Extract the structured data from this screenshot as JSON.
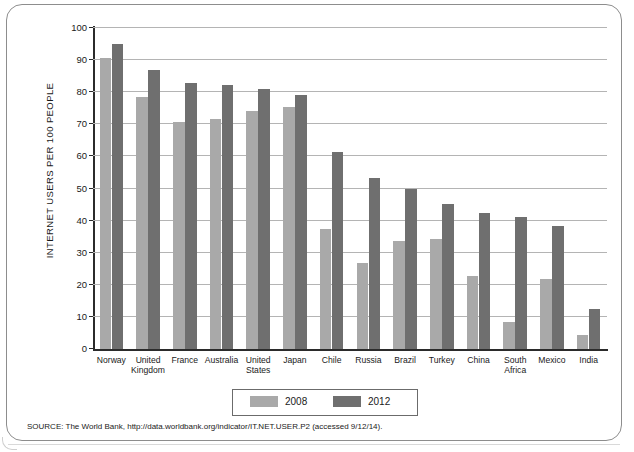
{
  "figure": {
    "y_axis_title": "INTERNET USERS PER 100 PEOPLE",
    "source_note": "SOURCE: The World Bank, http://data.worldbank.org/indicator/IT.NET.USER.P2 (accessed 9/12/14)."
  },
  "legend": {
    "entries": [
      {
        "label": "2008",
        "color": "#a9a9a9"
      },
      {
        "label": "2012",
        "color": "#6f6f6f"
      }
    ]
  },
  "chart_data": {
    "type": "bar",
    "title": "",
    "xlabel": "",
    "ylabel": "INTERNET USERS PER 100 PEOPLE",
    "ylim": [
      0,
      100
    ],
    "yticks": [
      0,
      10,
      20,
      30,
      40,
      50,
      60,
      70,
      80,
      90,
      100
    ],
    "ytick_labels": [
      "0",
      "10",
      "20",
      "30",
      "40",
      "50",
      "60",
      "70",
      "80",
      "90",
      "100"
    ],
    "grid": true,
    "legend_position": "bottom-center",
    "categories": [
      "Norway",
      "United Kingdom",
      "France",
      "Australia",
      "United States",
      "Japan",
      "Chile",
      "Russia",
      "Brazil",
      "Turkey",
      "China",
      "South Africa",
      "Mexico",
      "India"
    ],
    "series": [
      {
        "name": "2008",
        "color": "#a9a9a9",
        "values": [
          90.6,
          78.4,
          70.7,
          71.7,
          74.0,
          75.4,
          37.3,
          26.8,
          33.8,
          34.4,
          22.6,
          8.4,
          21.7,
          4.4
        ]
      },
      {
        "name": "2012",
        "color": "#6f6f6f",
        "values": [
          95.0,
          87.0,
          83.0,
          82.3,
          81.0,
          79.1,
          61.4,
          53.3,
          49.8,
          45.1,
          42.3,
          41.0,
          38.4,
          12.6
        ]
      }
    ]
  }
}
